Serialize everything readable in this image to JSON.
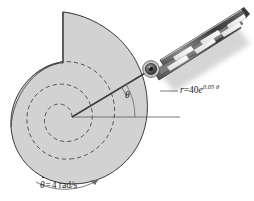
{
  "figure": {
    "background_color": "#ffffff",
    "cam_fill_color": "#d2d2d2",
    "outline_color": "#3c3c3c",
    "line_color": "#555555",
    "text_color": "#1a1a1a",
    "shadow_color": "#b8b8b8"
  },
  "labels": {
    "spiral_equation": {
      "variable": "r",
      "equals": "=",
      "coefficient": "40",
      "base": "e",
      "exponent": "0.05 θ",
      "full_text": "r = 40e^0.05θ"
    },
    "angle": {
      "symbol": "θ",
      "name": "theta-angle"
    },
    "angular_velocity": {
      "symbol": "θ",
      "equals": "=",
      "value": "4",
      "units": "rad/s",
      "full_text": "θ̇ = 4 rad/s"
    }
  },
  "parts": {
    "cam": "spiral-cam-disk",
    "notch_edge": "cam-step-edge",
    "inner_spiral": "dashed-inner-spiral",
    "radial_arm": "radial-line",
    "reference_axis": "horizontal-reference-line",
    "pin": "roller-pin",
    "guide": "slotted-guide-bar",
    "rotation_arrow": "rotation-direction-arrow",
    "leader": "equation-leader-line"
  },
  "geometry": {
    "center_x": 72,
    "center_y": 117,
    "pin_x": 151,
    "pin_y": 69,
    "angle_degrees": 31,
    "reference_axis_end_x": 180
  }
}
